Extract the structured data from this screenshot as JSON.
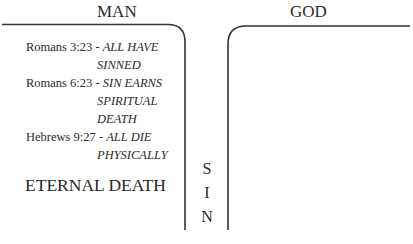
{
  "headers": {
    "left": "MAN",
    "right": "GOD"
  },
  "verses": [
    {
      "ref": "Romans 3:23 - ",
      "line1": "ALL HAVE",
      "line2": "SINNED"
    },
    {
      "ref": "Romans 6:23 - ",
      "line1": "SIN EARNS",
      "line2": "SPIRITUAL",
      "line3": "DEATH"
    },
    {
      "ref": "Hebrews 9:27 - ",
      "line1": "ALL DIE",
      "line2": "PHYSICALLY"
    }
  ],
  "conclusion": "ETERNAL DEATH",
  "chasm": {
    "letters": [
      "S",
      "I",
      "N"
    ]
  },
  "colors": {
    "line": "#333333",
    "text": "#2a2a2a"
  }
}
